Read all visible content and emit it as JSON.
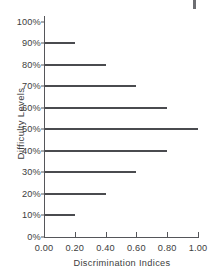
{
  "chart_data": {
    "type": "bar",
    "orientation": "horizontal",
    "title": "",
    "xlabel": "Discrimination Indices",
    "ylabel": "Difficulty Levels",
    "categories": [
      "0%",
      "10%",
      "20%",
      "30%",
      "40%",
      "50%",
      "60%",
      "70%",
      "80%",
      "90%",
      "100%"
    ],
    "values": [
      0.0,
      0.2,
      0.4,
      0.6,
      0.8,
      1.0,
      0.8,
      0.6,
      0.4,
      0.2,
      0.0
    ],
    "xlim": [
      0.0,
      1.0
    ],
    "xticks": [
      "0.00",
      "0.20",
      "0.40",
      "0.60",
      "0.80",
      "1.00"
    ],
    "xtick_values": [
      0.0,
      0.2,
      0.4,
      0.6,
      0.8,
      1.0
    ],
    "grid": false,
    "legend": null,
    "series_color": "#4a4b4f",
    "axis_color": "#55565a",
    "background": "#ffffff"
  }
}
